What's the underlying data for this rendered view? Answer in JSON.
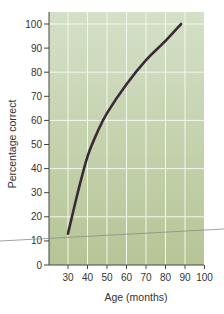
{
  "chart_data": {
    "type": "line",
    "title": "",
    "xlabel": "Age (months)",
    "ylabel": "Percentage correct",
    "xlim": [
      20,
      100
    ],
    "ylim": [
      0,
      105
    ],
    "x_ticks": [
      30,
      40,
      50,
      60,
      70,
      80,
      90,
      100
    ],
    "y_ticks": [
      0,
      10,
      20,
      30,
      40,
      50,
      60,
      70,
      80,
      90,
      100
    ],
    "grid": {
      "vertical_every": 10,
      "horizontal_every": 20
    },
    "legend": null,
    "series": [
      {
        "name": "Percentage correct",
        "x": [
          30,
          35,
          40,
          45,
          50,
          60,
          70,
          80,
          88
        ],
        "y": [
          13,
          30,
          45,
          55,
          63,
          75,
          85,
          93,
          100
        ]
      }
    ],
    "annotations": [
      {
        "type": "reference-line",
        "description": "thin grey diagonal line crossing near y=10",
        "approx_y": 10
      }
    ]
  },
  "colors": {
    "plot_bg_top": "#d4e0c7",
    "plot_bg_bottom": "#b6c596",
    "grid": "#f4f7ec",
    "curve": "#3a2a36",
    "axis": "#444444",
    "ref_line": "#8a8f86"
  },
  "labels": {
    "xlabel": "Age (months)",
    "ylabel": "Percentage correct",
    "xticks": [
      "30",
      "40",
      "50",
      "60",
      "70",
      "80",
      "90",
      "100"
    ],
    "yticks": [
      "0",
      "10",
      "20",
      "30",
      "40",
      "50",
      "60",
      "70",
      "80",
      "90",
      "100"
    ]
  }
}
